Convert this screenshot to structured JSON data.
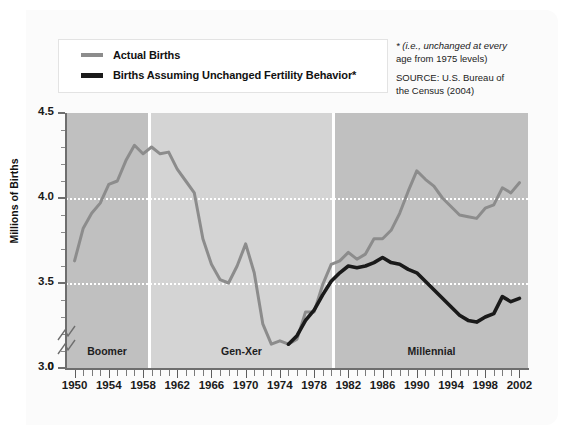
{
  "legend": {
    "entries": [
      {
        "label": "Actual Births",
        "color": "#8c8c8c",
        "key": "actual"
      },
      {
        "label": "Births Assuming Unchanged Fertility Behavior*",
        "color": "#1a1a1a",
        "key": "unchanged"
      }
    ]
  },
  "note": {
    "footnote_line1": "* (i.e., unchanged at every",
    "footnote_line2": "age from 1975 levels)",
    "source_line1": "SOURCE: U.S. Bureau of",
    "source_line2": "the Census (2004)"
  },
  "chart_data": {
    "type": "line",
    "title": "",
    "xlabel": "",
    "ylabel": "Millions of Births",
    "xlim": [
      1949,
      2003
    ],
    "ylim": [
      3.0,
      4.5
    ],
    "ytick_labels": [
      "4.5",
      "4.0",
      "3.5",
      "3.0",
      "0"
    ],
    "ytick_values": [
      4.5,
      4.0,
      3.5,
      3.0,
      0
    ],
    "axis_break": true,
    "grid": "horizontal-dotted-white",
    "gridlines": [
      4.0,
      3.5
    ],
    "legend_position": "top-left",
    "xtick_labels": [
      "1950",
      "1954",
      "1958",
      "1962",
      "1966",
      "1970",
      "1974",
      "1978",
      "1982",
      "1986",
      "1990",
      "1994",
      "1998",
      "2002"
    ],
    "xtick_values": [
      1950,
      1954,
      1958,
      1962,
      1966,
      1970,
      1974,
      1978,
      1982,
      1986,
      1990,
      1994,
      1998,
      2002
    ],
    "bands": [
      {
        "label": "Boomer",
        "start": 1949.0,
        "end": 1960.6,
        "color": "#c0c0c0"
      },
      {
        "label": "Gen-Xer",
        "start": 1960.9,
        "end": 1981.9,
        "color": "#d4d4d4"
      },
      {
        "label": "Millennial",
        "start": 1982.2,
        "end": 2003.0,
        "color": "#c0c0c0"
      }
    ],
    "x": [
      1950,
      1951,
      1952,
      1953,
      1954,
      1955,
      1956,
      1957,
      1958,
      1959,
      1960,
      1961,
      1962,
      1963,
      1964,
      1965,
      1966,
      1967,
      1968,
      1969,
      1970,
      1971,
      1972,
      1973,
      1974,
      1975,
      1976,
      1977,
      1978,
      1979,
      1980,
      1981,
      1982,
      1983,
      1984,
      1985,
      1986,
      1987,
      1988,
      1989,
      1990,
      1991,
      1992,
      1993,
      1994,
      1995,
      1996,
      1997,
      1998,
      1999,
      2000,
      2001,
      2002
    ],
    "series": [
      {
        "name": "Actual Births",
        "key": "actual",
        "color": "#8c8c8c",
        "values": [
          3.63,
          3.82,
          3.91,
          3.97,
          4.08,
          4.1,
          4.22,
          4.31,
          4.26,
          4.3,
          4.26,
          4.27,
          4.17,
          4.1,
          4.03,
          3.76,
          3.61,
          3.52,
          3.5,
          3.6,
          3.73,
          3.56,
          3.26,
          3.14,
          3.16,
          3.14,
          3.17,
          3.33,
          3.33,
          3.49,
          3.61,
          3.63,
          3.68,
          3.64,
          3.67,
          3.76,
          3.76,
          3.81,
          3.91,
          4.04,
          4.16,
          4.11,
          4.07,
          4.0,
          3.95,
          3.9,
          3.89,
          3.88,
          3.94,
          3.96,
          4.06,
          4.03,
          4.09
        ]
      },
      {
        "name": "Births Assuming Unchanged Fertility Behavior",
        "key": "unchanged",
        "color": "#1a1a1a",
        "start_year": 1975,
        "values": [
          null,
          null,
          null,
          null,
          null,
          null,
          null,
          null,
          null,
          null,
          null,
          null,
          null,
          null,
          null,
          null,
          null,
          null,
          null,
          null,
          null,
          null,
          null,
          null,
          null,
          3.14,
          3.19,
          3.28,
          3.34,
          3.43,
          3.51,
          3.56,
          3.6,
          3.59,
          3.6,
          3.62,
          3.65,
          3.62,
          3.61,
          3.58,
          3.56,
          3.51,
          3.46,
          3.41,
          3.36,
          3.31,
          3.28,
          3.27,
          3.3,
          3.32,
          3.42,
          3.39,
          3.41
        ]
      }
    ]
  },
  "bands_display": [
    {
      "label": "Boomer"
    },
    {
      "label": "Gen-Xer"
    },
    {
      "label": "Millennial"
    }
  ]
}
